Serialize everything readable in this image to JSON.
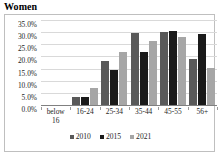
{
  "title": "Women",
  "chart_data": {
    "type": "bar",
    "title": "Women",
    "xlabel": "",
    "ylabel": "",
    "ylim": [
      0,
      35
    ],
    "ytick_step": 5,
    "grid": true,
    "legend_position": "bottom",
    "yticks": [
      "0.0%",
      "5.0%",
      "10.0%",
      "15.0%",
      "20.0%",
      "25.0%",
      "30.0%",
      "35.0%"
    ],
    "ytick_values": [
      0,
      5,
      10,
      15,
      20,
      25,
      30,
      35
    ],
    "categories": [
      "below 16",
      "16-24",
      "25-34",
      "35-44",
      "45-55",
      "56+"
    ],
    "series": [
      {
        "name": "2010",
        "color": "#595959",
        "values": [
          0,
          3.3,
          18.3,
          29.5,
          30.0,
          19.0
        ]
      },
      {
        "name": "2015",
        "color": "#1a1a1a",
        "values": [
          0,
          3.3,
          14.5,
          22.0,
          30.5,
          29.2
        ]
      },
      {
        "name": "2021",
        "color": "#a6a6a6",
        "values": [
          0,
          7.2,
          22.0,
          26.3,
          28.2,
          15.3
        ]
      }
    ]
  }
}
